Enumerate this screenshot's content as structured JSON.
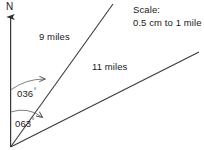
{
  "diagram": {
    "type": "bearings-diagram",
    "background_color": "#ffffff",
    "line_color": "#3a3a3a",
    "text_color": "#1a1a1a",
    "north_label": "N",
    "scale": {
      "title": "Scale:",
      "value": "0.5 cm to 1 mile"
    },
    "legs": [
      {
        "id": "leg-1",
        "distance_label": "9 miles",
        "distance_miles": 9,
        "bearing_label": "036",
        "bearing_degrees": 36,
        "degree_symbol": "°"
      },
      {
        "id": "leg-2",
        "distance_label": "11 miles",
        "distance_miles": 11,
        "bearing_label": "063",
        "bearing_degrees": 63,
        "degree_symbol": "°"
      }
    ],
    "origin": {
      "x": 10,
      "y": 147
    },
    "north_arrow_tip": {
      "y": 16
    }
  }
}
